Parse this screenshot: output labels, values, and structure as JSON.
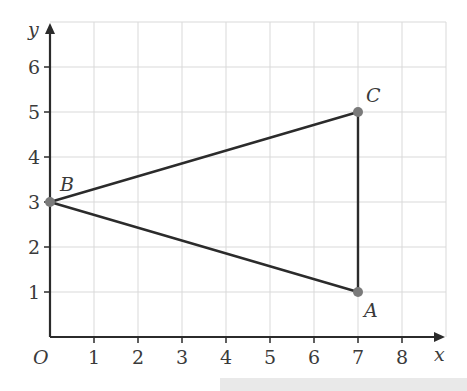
{
  "diagram": {
    "axes": {
      "x_label": "x",
      "y_label": "y",
      "origin_label": "O",
      "x_ticks": [
        "1",
        "2",
        "3",
        "4",
        "5",
        "6",
        "7",
        "8"
      ],
      "y_ticks": [
        "1",
        "2",
        "3",
        "4",
        "5",
        "6"
      ],
      "x_range": [
        0,
        9
      ],
      "y_range": [
        0,
        7
      ],
      "grid": true
    },
    "points": [
      {
        "name": "A",
        "x": 7,
        "y": 1
      },
      {
        "name": "B",
        "x": 0,
        "y": 3
      },
      {
        "name": "C",
        "x": 7,
        "y": 5
      }
    ],
    "segments": [
      [
        "B",
        "C"
      ],
      [
        "C",
        "A"
      ],
      [
        "A",
        "B"
      ]
    ],
    "colors": {
      "line": "#2b2b2b",
      "point": "#7a7a7a",
      "grid": "#d9d9d9",
      "text": "#3a3a3a"
    }
  }
}
